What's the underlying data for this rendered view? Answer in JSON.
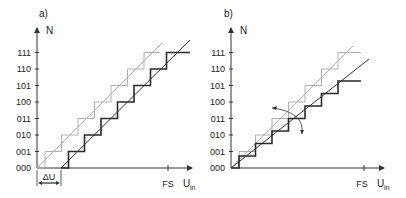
{
  "panel_a": {
    "label": "a)",
    "y_axis_label": "N",
    "x_axis_label_main": "U",
    "x_axis_label_sub": "in",
    "fs_label": "FS",
    "offset_label": "ΔU",
    "codes": [
      "000",
      "001",
      "010",
      "011",
      "100",
      "101",
      "110",
      "111"
    ]
  },
  "panel_b": {
    "label": "b)",
    "y_axis_label": "N",
    "x_axis_label_main": "U",
    "x_axis_label_sub": "in",
    "fs_label": "FS",
    "codes": [
      "000",
      "001",
      "010",
      "011",
      "100",
      "101",
      "110",
      "111"
    ]
  },
  "colors": {
    "ideal": "#b0b0b0",
    "actual": "#2a2a2a",
    "axis": "#333333"
  }
}
